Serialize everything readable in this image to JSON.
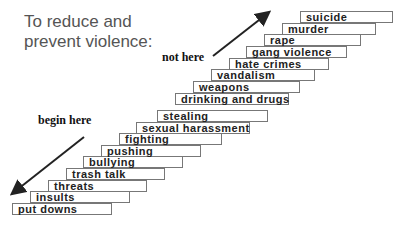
{
  "title": {
    "line1": "To reduce and",
    "line2": "prevent violence:"
  },
  "labels": {
    "not_here": "not here",
    "begin_here": "begin here"
  },
  "steps": [
    {
      "label": "put downs",
      "x": 12,
      "y": 203,
      "w": 100
    },
    {
      "label": "insults",
      "x": 30,
      "y": 191,
      "w": 100
    },
    {
      "label": "threats",
      "x": 48,
      "y": 180,
      "w": 99
    },
    {
      "label": "trash talk",
      "x": 66,
      "y": 168,
      "w": 99
    },
    {
      "label": "bullying",
      "x": 83,
      "y": 156,
      "w": 100
    },
    {
      "label": "pushing",
      "x": 101,
      "y": 145,
      "w": 100
    },
    {
      "label": "fighting",
      "x": 119,
      "y": 133,
      "w": 103
    },
    {
      "label": "sexual harassment",
      "x": 136,
      "y": 122,
      "w": 114
    },
    {
      "label": "stealing",
      "x": 157,
      "y": 110,
      "w": 111
    },
    {
      "label": "drinking and drugs",
      "x": 175,
      "y": 93,
      "w": 114
    },
    {
      "label": "weapons",
      "x": 193,
      "y": 81,
      "w": 107
    },
    {
      "label": "vandalism",
      "x": 211,
      "y": 69,
      "w": 104
    },
    {
      "label": "hate crimes",
      "x": 229,
      "y": 58,
      "w": 100
    },
    {
      "label": "gang violence",
      "x": 246,
      "y": 46,
      "w": 101
    },
    {
      "label": "rape",
      "x": 264,
      "y": 34,
      "w": 97
    },
    {
      "label": "murder",
      "x": 282,
      "y": 23,
      "w": 94
    },
    {
      "label": "suicide",
      "x": 300,
      "y": 11,
      "w": 93
    }
  ]
}
